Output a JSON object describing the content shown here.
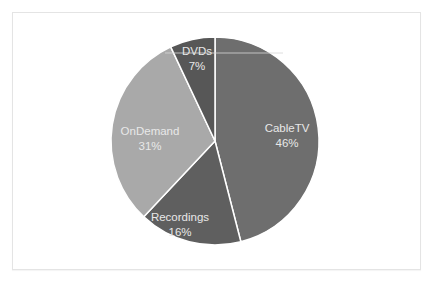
{
  "chart_data": {
    "type": "pie",
    "title": "",
    "categories": [
      "CableTV",
      "Recordings",
      "OnDemand",
      "DVDs"
    ],
    "values": [
      46,
      16,
      31,
      7
    ],
    "units": "%",
    "colors": [
      "#6e6e6e",
      "#5f5f5f",
      "#a9a9a9",
      "#575757"
    ],
    "start_angle": "12 o'clock",
    "direction": "clockwise",
    "legend": "none",
    "data_labels": [
      {
        "name": "CableTV",
        "percent": "46%"
      },
      {
        "name": "Recordings",
        "percent": "16%"
      },
      {
        "name": "OnDemand",
        "percent": "31%"
      },
      {
        "name": "DVDs",
        "percent": "7%"
      }
    ]
  },
  "labels": {
    "cabletv": {
      "name": "CableTV",
      "pct": "46%"
    },
    "recordings": {
      "name": "Recordings",
      "pct": "16%"
    },
    "ondemand": {
      "name": "OnDemand",
      "pct": "31%"
    },
    "dvds": {
      "name": "DVDs",
      "pct": "7%"
    }
  }
}
